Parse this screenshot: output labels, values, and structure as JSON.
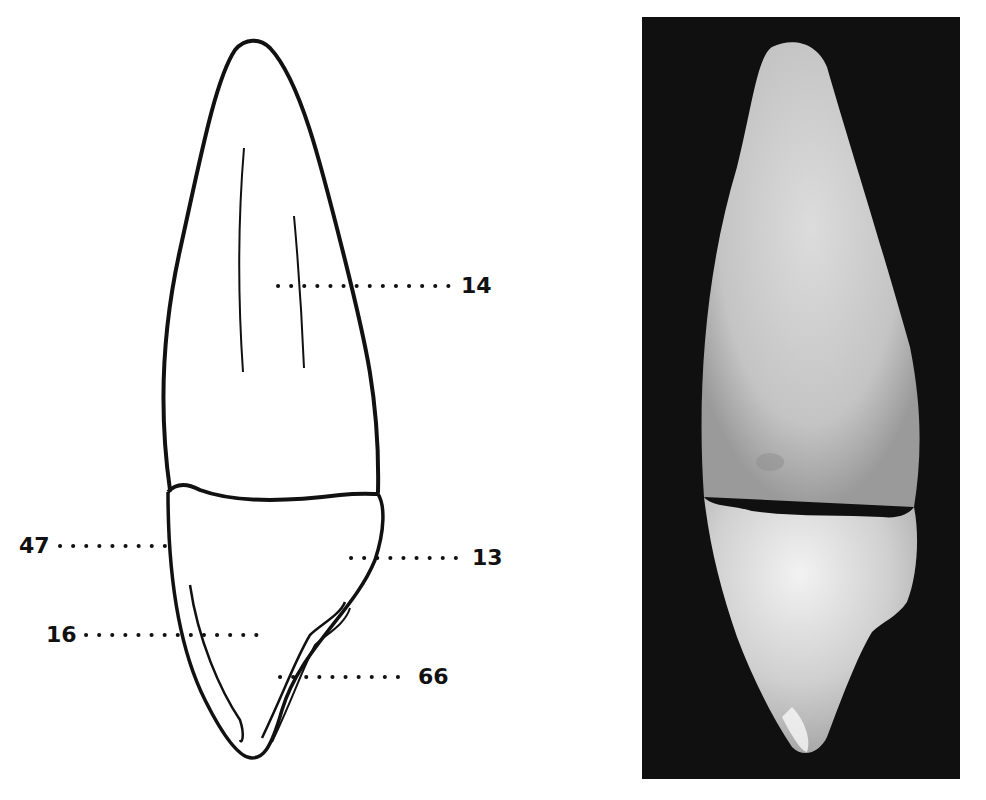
{
  "figure": {
    "left_panel": {
      "type": "line-drawing",
      "subject": "tooth-outline",
      "labels": [
        {
          "id": "14",
          "text": "14",
          "side": "right"
        },
        {
          "id": "47",
          "text": "47",
          "side": "left"
        },
        {
          "id": "13",
          "text": "13",
          "side": "right"
        },
        {
          "id": "16",
          "text": "16",
          "side": "left"
        },
        {
          "id": "66",
          "text": "66",
          "side": "right"
        }
      ]
    },
    "right_panel": {
      "type": "photograph",
      "subject": "tooth-photo",
      "background_color": "#101010"
    },
    "colors": {
      "ink": "#111111",
      "paper": "#ffffff",
      "photo_background": "#101010",
      "tooth_light": "#e8e8e8",
      "tooth_mid": "#bdbdbd"
    }
  }
}
